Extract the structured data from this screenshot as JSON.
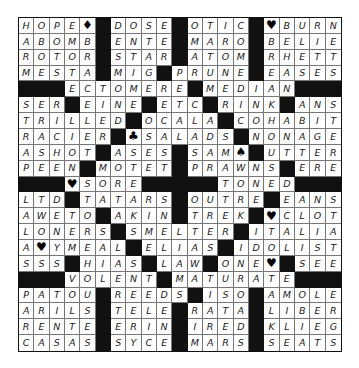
{
  "puzzle": {
    "rows": 21,
    "cols": 21,
    "black_symbol": "#",
    "symbol_legend": {
      "♦": "diamond-icon",
      "♥": "heart-icon",
      "♣": "club-icon",
      "♠": "spade-icon"
    },
    "grid": [
      [
        "H",
        "O",
        "P",
        "E",
        "♦",
        "#",
        "D",
        "O",
        "S",
        "E",
        "#",
        "O",
        "T",
        "I",
        "C",
        "#",
        "♥",
        "B",
        "U",
        "R",
        "N"
      ],
      [
        "A",
        "B",
        "O",
        "M",
        "B",
        "#",
        "E",
        "N",
        "T",
        "E",
        "#",
        "M",
        "A",
        "R",
        "O",
        "#",
        "B",
        "E",
        "L",
        "I",
        "E"
      ],
      [
        "R",
        "O",
        "T",
        "O",
        "R",
        "#",
        "S",
        "T",
        "A",
        "R",
        "#",
        "A",
        "T",
        "O",
        "M",
        "#",
        "R",
        "H",
        "E",
        "T",
        "T"
      ],
      [
        "M",
        "E",
        "S",
        "T",
        "A",
        "#",
        "M",
        "I",
        "G",
        "#",
        "P",
        "R",
        "U",
        "N",
        "E",
        "#",
        "E",
        "A",
        "S",
        "E",
        "S"
      ],
      [
        "#",
        "#",
        "#",
        "E",
        "C",
        "T",
        "O",
        "M",
        "E",
        "R",
        "E",
        "#",
        "M",
        "E",
        "D",
        "I",
        "A",
        "N",
        "#",
        "#",
        "#"
      ],
      [
        "S",
        "E",
        "R",
        "#",
        "E",
        "I",
        "N",
        "E",
        "#",
        "E",
        "T",
        "C",
        "#",
        "R",
        "I",
        "N",
        "K",
        "#",
        "A",
        "N",
        "S"
      ],
      [
        "T",
        "R",
        "I",
        "L",
        "L",
        "E",
        "D",
        "#",
        "O",
        "C",
        "A",
        "L",
        "A",
        "#",
        "C",
        "O",
        "H",
        "A",
        "B",
        "I",
        "T"
      ],
      [
        "R",
        "A",
        "C",
        "I",
        "E",
        "R",
        "#",
        "♣",
        "S",
        "A",
        "L",
        "A",
        "D",
        "S",
        "#",
        "N",
        "O",
        "N",
        "A",
        "G",
        "E"
      ],
      [
        "A",
        "S",
        "H",
        "O",
        "T",
        "#",
        "A",
        "S",
        "E",
        "S",
        "#",
        "S",
        "A",
        "M",
        "♠",
        "#",
        "U",
        "T",
        "T",
        "E",
        "R"
      ],
      [
        "P",
        "E",
        "E",
        "N",
        "#",
        "M",
        "O",
        "T",
        "E",
        "T",
        "#",
        "P",
        "R",
        "A",
        "W",
        "N",
        "S",
        "#",
        "E",
        "R",
        "E"
      ],
      [
        "#",
        "#",
        "#",
        "♥",
        "S",
        "O",
        "R",
        "E",
        "#",
        "#",
        "#",
        "#",
        "#",
        "T",
        "O",
        "N",
        "E",
        "D",
        "#",
        "#",
        "#"
      ],
      [
        "L",
        "T",
        "D",
        "#",
        "T",
        "A",
        "T",
        "A",
        "R",
        "S",
        "#",
        "O",
        "U",
        "T",
        "R",
        "E",
        "#",
        "E",
        "A",
        "N",
        "S"
      ],
      [
        "A",
        "W",
        "E",
        "T",
        "O",
        "#",
        "A",
        "K",
        "I",
        "N",
        "#",
        "T",
        "R",
        "E",
        "K",
        "#",
        "♥",
        "C",
        "L",
        "O",
        "T"
      ],
      [
        "L",
        "O",
        "N",
        "E",
        "R",
        "S",
        "#",
        "S",
        "M",
        "E",
        "L",
        "T",
        "E",
        "R",
        "#",
        "I",
        "T",
        "A",
        "L",
        "I",
        "A"
      ],
      [
        "A",
        "♥",
        "Y",
        "M",
        "E",
        "A",
        "L",
        "#",
        "E",
        "L",
        "I",
        "A",
        "S",
        "#",
        "I",
        "D",
        "O",
        "L",
        "I",
        "S",
        "T"
      ],
      [
        "S",
        "S",
        "S",
        "#",
        "H",
        "I",
        "A",
        "S",
        "#",
        "L",
        "A",
        "W",
        "#",
        "O",
        "N",
        "E",
        "♥",
        "#",
        "S",
        "E",
        "E"
      ],
      [
        "#",
        "#",
        "#",
        "V",
        "O",
        "L",
        "E",
        "N",
        "T",
        "#",
        "M",
        "A",
        "T",
        "U",
        "R",
        "A",
        "T",
        "E",
        "#",
        "#",
        "#"
      ],
      [
        "P",
        "A",
        "T",
        "O",
        "U",
        "#",
        "R",
        "E",
        "E",
        "D",
        "S",
        "#",
        "I",
        "S",
        "O",
        "#",
        "A",
        "M",
        "O",
        "L",
        "E"
      ],
      [
        "A",
        "R",
        "I",
        "L",
        "S",
        "#",
        "T",
        "E",
        "L",
        "E",
        "#",
        "R",
        "A",
        "T",
        "A",
        "#",
        "L",
        "I",
        "B",
        "E",
        "R"
      ],
      [
        "R",
        "E",
        "N",
        "T",
        "E",
        "#",
        "E",
        "R",
        "I",
        "N",
        "#",
        "I",
        "R",
        "E",
        "D",
        "#",
        "K",
        "L",
        "I",
        "E",
        "G"
      ],
      [
        "C",
        "A",
        "S",
        "A",
        "S",
        "#",
        "S",
        "Y",
        "C",
        "E",
        "#",
        "M",
        "A",
        "R",
        "S",
        "#",
        "S",
        "E",
        "A",
        "T",
        "S"
      ]
    ]
  }
}
